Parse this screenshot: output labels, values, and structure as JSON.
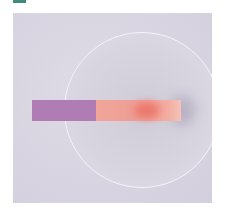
{
  "image": {
    "description": "Photograph of a pH indicator paper strip lying on a watch glass; the dry end is purple and the wetted end has turned pink/red",
    "marker": {
      "color": "#3f8a78"
    },
    "background": {
      "color": "#dedbe6",
      "shade": "#d3cfdd"
    },
    "watch_glass": {
      "color": "#d8d5e0",
      "rim": "#f4f3f8",
      "center_x": 129,
      "center_y": 97,
      "radius": 78
    },
    "strip": {
      "x": 19,
      "y": 87,
      "width": 149,
      "height": 21,
      "segments": [
        {
          "name": "dry-end",
          "color": "#b07cb4",
          "width": 64
        },
        {
          "name": "wet-end",
          "color": "#ef9f96",
          "width": 85
        }
      ],
      "reaction_spot": {
        "color": "#e9675c",
        "x": 121,
        "y": 89,
        "w": 26,
        "h": 17
      }
    }
  }
}
